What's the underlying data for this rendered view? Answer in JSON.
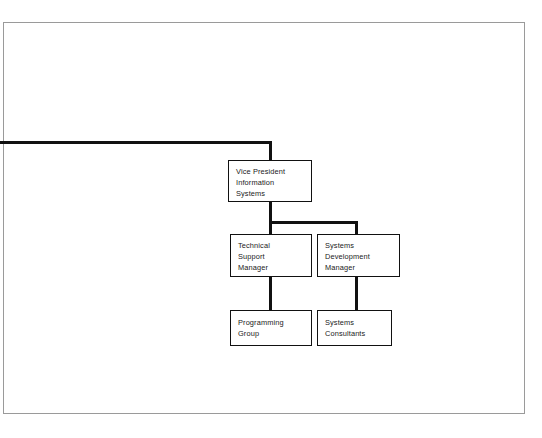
{
  "diagram": {
    "line_color": "#111111",
    "frame_color": "#9a9a9a",
    "background": "#ffffff",
    "nodes": [
      {
        "id": "vice-president",
        "label": "Vice President\nInformation\nSystems"
      },
      {
        "id": "technical-support-manager",
        "label": "Technical\nSupport\nManager"
      },
      {
        "id": "systems-development-manager",
        "label": "Systems\nDevelopment\nManager"
      },
      {
        "id": "programming-group",
        "label": "Programming\nGroup"
      },
      {
        "id": "systems-consultants",
        "label": "Systems\nConsultants"
      }
    ],
    "edges": [
      {
        "from": "external-parent",
        "to": "vice-president"
      },
      {
        "from": "vice-president",
        "to": "technical-support-manager"
      },
      {
        "from": "vice-president",
        "to": "systems-development-manager"
      },
      {
        "from": "technical-support-manager",
        "to": "programming-group"
      },
      {
        "from": "systems-development-manager",
        "to": "systems-consultants"
      }
    ]
  }
}
